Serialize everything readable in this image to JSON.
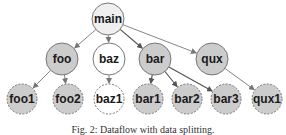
{
  "diagram": {
    "colors": {
      "root_fill": "#efefef",
      "shaded_fill": "#cccccc",
      "plain_fill": "#ffffff",
      "stroke": "#777777",
      "edge": "#777777",
      "edge_dark": "#555555"
    },
    "nodes": [
      {
        "id": "main",
        "label": "main",
        "x": 108,
        "y": 19,
        "r": 16,
        "style": "root",
        "dashed": false
      },
      {
        "id": "foo",
        "label": "foo",
        "x": 62,
        "y": 59,
        "r": 16,
        "style": "shaded",
        "dashed": false
      },
      {
        "id": "baz",
        "label": "baz",
        "x": 109,
        "y": 59,
        "r": 16,
        "style": "plain",
        "dashed": false
      },
      {
        "id": "bar",
        "label": "bar",
        "x": 155,
        "y": 59,
        "r": 16,
        "style": "shaded",
        "dashed": false
      },
      {
        "id": "qux",
        "label": "qux",
        "x": 212,
        "y": 59,
        "r": 16,
        "style": "shaded",
        "dashed": false
      },
      {
        "id": "foo1",
        "label": "foo1",
        "x": 22,
        "y": 99,
        "r": 15,
        "style": "shaded",
        "dashed": true
      },
      {
        "id": "foo2",
        "label": "foo2",
        "x": 68,
        "y": 99,
        "r": 15,
        "style": "shaded",
        "dashed": true
      },
      {
        "id": "baz1",
        "label": "baz1",
        "x": 109,
        "y": 99,
        "r": 15,
        "style": "plain",
        "dashed": true
      },
      {
        "id": "bar1",
        "label": "bar1",
        "x": 148,
        "y": 99,
        "r": 15,
        "style": "shaded",
        "dashed": true
      },
      {
        "id": "bar2",
        "label": "bar2",
        "x": 187,
        "y": 99,
        "r": 15,
        "style": "shaded",
        "dashed": true
      },
      {
        "id": "bar3",
        "label": "bar3",
        "x": 226,
        "y": 99,
        "r": 15,
        "style": "shaded",
        "dashed": true
      },
      {
        "id": "qux1",
        "label": "qux1",
        "x": 267,
        "y": 99,
        "r": 15,
        "style": "shaded",
        "dashed": true
      }
    ],
    "edges": [
      {
        "from": "main",
        "to": "foo",
        "dark": false
      },
      {
        "from": "main",
        "to": "baz",
        "dark": false
      },
      {
        "from": "main",
        "to": "bar",
        "dark": true
      },
      {
        "from": "main",
        "to": "qux",
        "dark": false
      },
      {
        "from": "foo",
        "to": "foo1",
        "dark": false
      },
      {
        "from": "foo",
        "to": "foo2",
        "dark": false
      },
      {
        "from": "baz",
        "to": "baz1",
        "dark": false
      },
      {
        "from": "bar",
        "to": "bar1",
        "dark": true
      },
      {
        "from": "bar",
        "to": "bar2",
        "dark": true
      },
      {
        "from": "bar",
        "to": "bar3",
        "dark": true
      },
      {
        "from": "qux",
        "to": "qux1",
        "dark": false
      }
    ]
  },
  "caption": "Fig. 2: Dataflow with data splitting."
}
